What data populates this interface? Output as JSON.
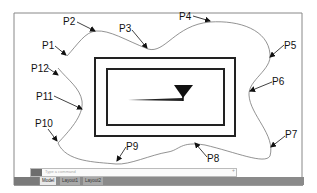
{
  "diagram": {
    "point_labels": [
      "P1",
      "P2",
      "P3",
      "P4",
      "P5",
      "P6",
      "P7",
      "P8",
      "P9",
      "P10",
      "P11",
      "P12"
    ]
  },
  "command_line": {
    "placeholder": "Type a command"
  },
  "layout_tabs": [
    {
      "label": "Model",
      "active": true
    },
    {
      "label": "Layout1",
      "active": false
    },
    {
      "label": "Layout2",
      "active": false
    }
  ],
  "colors": {
    "curve": "#777777",
    "rect": "#222222",
    "frame": "#888888"
  }
}
